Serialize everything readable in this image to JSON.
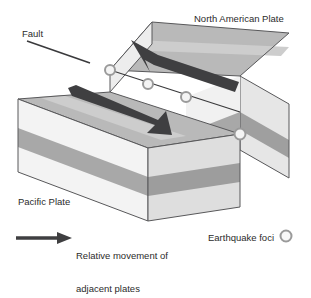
{
  "diagram": {
    "type": "block-diagram",
    "labels": {
      "north_american_plate": "North American Plate",
      "pacific_plate": "Pacific Plate",
      "fault": "Fault"
    },
    "legend": {
      "movement_line1": "Relative movement of",
      "movement_line2": "adjacent plates",
      "foci": "Earthquake foci",
      "arrow_icon": "right-arrow-icon",
      "foci_icon": "circle-ring-icon"
    },
    "arrows": [
      {
        "name": "back-block-motion-arrow",
        "direction": "up-left"
      },
      {
        "name": "front-block-motion-arrow",
        "direction": "down-right"
      }
    ],
    "earthquake_foci": [
      {
        "x": 110,
        "y": 70
      },
      {
        "x": 148,
        "y": 84
      },
      {
        "x": 186,
        "y": 97
      },
      {
        "x": 240,
        "y": 134
      }
    ],
    "colors": {
      "top_surface": "#b9b9b9",
      "top_surface_light_band": "#cfcfcf",
      "side_light": "#f1f1f1",
      "side_dark_band": "#a8a8a8",
      "side_shaded": "#dcdcdc",
      "side_shaded_dark_band": "#9a9a9a",
      "outline": "#58585a",
      "arrow": "#3f3f41",
      "text": "#2b2b2b",
      "foci_fill": "#f4f4f4",
      "foci_stroke": "#9a9a9a"
    }
  }
}
